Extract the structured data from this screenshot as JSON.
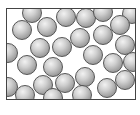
{
  "diagram": {
    "container": {
      "left": 6,
      "top": 8,
      "width": 130,
      "height": 92,
      "border_color": "#444444"
    },
    "sphere_style": {
      "radius": 10,
      "fill_light": "#f2f2f2",
      "fill_mid": "#cfcfcf",
      "fill_dark": "#7a7a7a",
      "outline": "#555555"
    },
    "spheres": [
      {
        "cx": 32,
        "cy": 13
      },
      {
        "cx": 66,
        "cy": 17
      },
      {
        "cx": 86,
        "cy": 18
      },
      {
        "cx": 103,
        "cy": 12
      },
      {
        "cx": 132,
        "cy": 14
      },
      {
        "cx": 22,
        "cy": 30
      },
      {
        "cx": 47,
        "cy": 27
      },
      {
        "cx": 80,
        "cy": 38
      },
      {
        "cx": 103,
        "cy": 35
      },
      {
        "cx": 120,
        "cy": 25
      },
      {
        "cx": 8,
        "cy": 53
      },
      {
        "cx": 40,
        "cy": 48
      },
      {
        "cx": 62,
        "cy": 47
      },
      {
        "cx": 93,
        "cy": 55
      },
      {
        "cx": 125,
        "cy": 45
      },
      {
        "cx": 27,
        "cy": 65
      },
      {
        "cx": 53,
        "cy": 67
      },
      {
        "cx": 113,
        "cy": 63
      },
      {
        "cx": 133,
        "cy": 62
      },
      {
        "cx": 8,
        "cy": 87
      },
      {
        "cx": 43,
        "cy": 85
      },
      {
        "cx": 65,
        "cy": 83
      },
      {
        "cx": 85,
        "cy": 77
      },
      {
        "cx": 107,
        "cy": 88
      },
      {
        "cx": 125,
        "cy": 80
      },
      {
        "cx": 25,
        "cy": 95
      },
      {
        "cx": 53,
        "cy": 98
      },
      {
        "cx": 82,
        "cy": 95
      }
    ]
  }
}
